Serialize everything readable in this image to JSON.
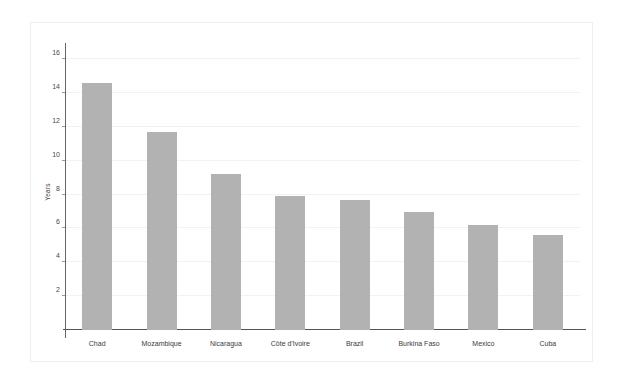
{
  "chart_data": {
    "type": "bar",
    "title": "",
    "subtitle": "",
    "xlabel": "",
    "ylabel": "Years",
    "categories": [
      "Chad",
      "Mozambique",
      "Nicaragua",
      "Côte d'Ivoire",
      "Brazil",
      "Burkina Faso",
      "Mexico",
      "Cuba"
    ],
    "values": [
      14.6,
      11.7,
      9.2,
      7.9,
      7.7,
      7.0,
      6.2,
      5.6
    ],
    "ylim": [
      0,
      16.6
    ],
    "yticks": [
      2,
      4,
      6,
      8,
      10,
      12,
      14,
      16
    ],
    "ytick_labels": [
      "2",
      "4",
      "6",
      "8",
      "10",
      "12",
      "14",
      "16"
    ],
    "grid": true,
    "grid_axis": "y",
    "legend": false,
    "legend_position": "none",
    "bar_color": "#b2b2b2",
    "gridline_color": "#f2f2f2",
    "axis_color": "#555555",
    "text_color": "#3b3b3b",
    "frame_color": "#eeeeee",
    "background_color": "#ffffff"
  }
}
